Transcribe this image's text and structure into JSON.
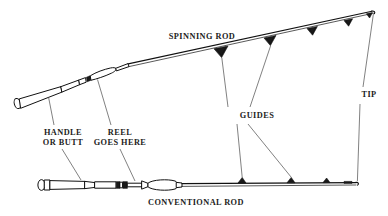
{
  "diagram": {
    "background_color": "#ffffff",
    "ink_color": "#111111",
    "leader_color": "#4a4a4a",
    "labels": {
      "spinning_rod": "SPINNING ROD",
      "conventional_rod": "CONVENTIONAL ROD",
      "handle_or_butt_line1": "HANDLE",
      "handle_or_butt_line2": "OR BUTT",
      "reel_goes_here_line1": "REEL",
      "reel_goes_here_line2": "GOES HERE",
      "guides": "GUIDES",
      "tip": "TIP"
    },
    "parts": [
      {
        "name": "HANDLE OR BUTT",
        "belongs_to": "both",
        "callout_targets": 2
      },
      {
        "name": "REEL GOES HERE",
        "belongs_to": "both",
        "callout_targets": 2
      },
      {
        "name": "GUIDES",
        "belongs_to": "both",
        "callout_targets": 4
      },
      {
        "name": "TIP",
        "belongs_to": "spinning rod",
        "callout_targets": 1
      }
    ],
    "rods": [
      {
        "id": "spinning-rod",
        "label": "SPINNING ROD",
        "orientation": "diagonal, butt lower-left to tip upper-right",
        "guide_direction": "below blank",
        "guide_count": 4
      },
      {
        "id": "conventional-rod",
        "label": "CONVENTIONAL ROD",
        "orientation": "horizontal, butt left to tip right",
        "guide_direction": "above blank",
        "guide_count": 4
      }
    ]
  }
}
